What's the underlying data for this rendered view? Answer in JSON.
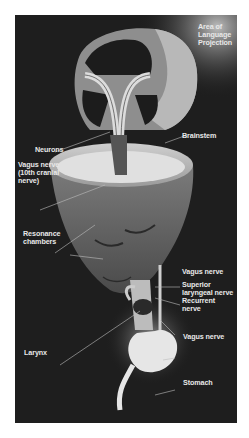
{
  "figure": {
    "background": "#1e1e1e",
    "label_color": "#e8e8e8",
    "labels": [
      {
        "id": "area-of-language-projection",
        "text": "Area of\nLanguage\nProjection"
      },
      {
        "id": "neurons",
        "text": "Neurons"
      },
      {
        "id": "brainstem",
        "text": "Brainstem"
      },
      {
        "id": "vagus-nerve-cranial",
        "text": "Vagus nerve\n(10th cranial\nnerve)"
      },
      {
        "id": "resonance-chambers",
        "text": "Resonance\nchambers"
      },
      {
        "id": "vagus-nerve-neck",
        "text": "Vagus nerve"
      },
      {
        "id": "superior-laryngeal-nerve",
        "text": "Superior\nlaryngeal nerve"
      },
      {
        "id": "recurrent-nerve",
        "text": "Recurrent\nnerve"
      },
      {
        "id": "larynx",
        "text": "Larynx"
      },
      {
        "id": "vagus-nerve-lower",
        "text": "Vagus nerve"
      },
      {
        "id": "stomach",
        "text": "Stomach"
      }
    ]
  }
}
